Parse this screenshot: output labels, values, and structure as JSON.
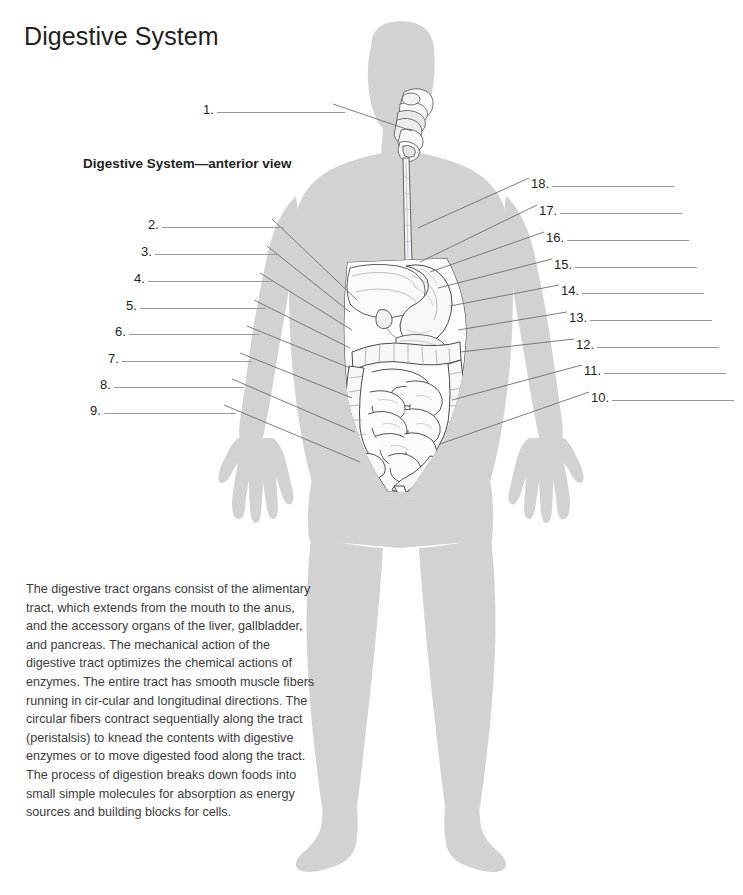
{
  "document": {
    "title": "Digestive System",
    "figure_caption": "Digestive System—anterior view"
  },
  "illustration": {
    "view": "anterior",
    "subject": "human-body-silhouette",
    "silhouette_color": "#d2d2d0",
    "organ_outline_color": "#4a4a4a",
    "leader_line_color": "#6e6e6e",
    "rule_color": "#9a9a9a",
    "organs_depicted": [
      "oral cavity",
      "pharynx",
      "esophagus",
      "liver",
      "stomach",
      "gallbladder",
      "pancreas",
      "transverse colon",
      "ascending colon",
      "descending colon",
      "small intestine",
      "cecum",
      "appendix",
      "sigmoid colon",
      "rectum"
    ]
  },
  "labels_left": [
    {
      "number": "1.",
      "x": 203,
      "y": 103,
      "rule_width": 128
    },
    {
      "number": "2.",
      "x": 148,
      "y": 218,
      "rule_width": 122
    },
    {
      "number": "3.",
      "x": 141,
      "y": 245,
      "rule_width": 124
    },
    {
      "number": "4.",
      "x": 134,
      "y": 272,
      "rule_width": 124
    },
    {
      "number": "5.",
      "x": 126,
      "y": 299,
      "rule_width": 126
    },
    {
      "number": "6.",
      "x": 115,
      "y": 325,
      "rule_width": 130
    },
    {
      "number": "7.",
      "x": 108,
      "y": 352,
      "rule_width": 130
    },
    {
      "number": "8.",
      "x": 100,
      "y": 378,
      "rule_width": 130
    },
    {
      "number": "9.",
      "x": 90,
      "y": 404,
      "rule_width": 132
    }
  ],
  "labels_right": [
    {
      "number": "18.",
      "x": 531,
      "y": 177,
      "rule_width": 122
    },
    {
      "number": "17.",
      "x": 539,
      "y": 204,
      "rule_width": 122
    },
    {
      "number": "16.",
      "x": 546,
      "y": 231,
      "rule_width": 122
    },
    {
      "number": "15.",
      "x": 554,
      "y": 258,
      "rule_width": 122
    },
    {
      "number": "14.",
      "x": 561,
      "y": 284,
      "rule_width": 122
    },
    {
      "number": "13.",
      "x": 569,
      "y": 311,
      "rule_width": 122
    },
    {
      "number": "12.",
      "x": 576,
      "y": 338,
      "rule_width": 122
    },
    {
      "number": "11.",
      "x": 584,
      "y": 364,
      "rule_width": 122
    },
    {
      "number": "10.",
      "x": 591,
      "y": 391,
      "rule_width": 122
    }
  ],
  "body_text": "The digestive tract organs consist of the alimentary tract, which extends from the mouth to the anus, and the accessory organs of the liver, gallbladder, and pancreas. The mechanical action of the digestive tract optimizes the chemical actions of enzymes. The entire tract has smooth muscle fibers running in cir-cular and longitudinal directions. The circular fibers contract sequentially along the tract (peristalsis) to knead the contents with digestive enzymes or to move digested food along the tract. The process of digestion breaks down foods into small simple molecules for absorption as energy sources and building blocks for cells."
}
